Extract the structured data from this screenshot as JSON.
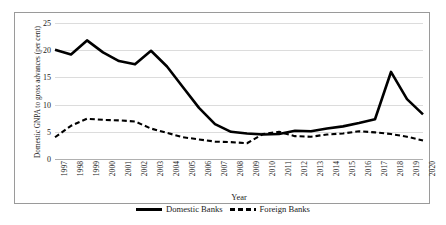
{
  "chart_data": {
    "type": "line",
    "title": "",
    "xlabel": "Year",
    "ylabel": "Domestic GNPA to gross advances (per cent)",
    "ylim": [
      0,
      25
    ],
    "yticks": [
      0,
      5,
      10,
      15,
      20,
      25
    ],
    "grid": true,
    "legend_position": "bottom",
    "categories": [
      "1997",
      "1998",
      "1999",
      "2000",
      "2001",
      "2002",
      "2003",
      "2004",
      "2005",
      "2006",
      "2007",
      "2008",
      "2009",
      "2010",
      "2011",
      "2012",
      "2013",
      "2014",
      "2015",
      "2016",
      "2017",
      "2018",
      "2019",
      "2020"
    ],
    "series": [
      {
        "name": "Domestic Banks",
        "style": "solid",
        "color": "#000000",
        "values": [
          20.1,
          19.2,
          21.8,
          19.6,
          18.0,
          17.4,
          19.9,
          17.0,
          13.2,
          9.4,
          6.4,
          5.0,
          4.7,
          4.5,
          4.6,
          5.2,
          5.1,
          5.6,
          6.0,
          6.6,
          7.3,
          16.0,
          11.0,
          8.2
        ]
      },
      {
        "name": "Foreign Banks",
        "style": "dashed",
        "color": "#000000",
        "values": [
          4.0,
          6.1,
          7.4,
          7.2,
          7.1,
          6.9,
          5.6,
          4.8,
          4.0,
          3.6,
          3.2,
          3.1,
          2.9,
          4.6,
          5.0,
          4.2,
          4.1,
          4.5,
          4.7,
          5.1,
          4.9,
          4.6,
          4.1,
          3.4
        ]
      }
    ]
  },
  "legend": {
    "items": [
      {
        "label": "Domestic Banks"
      },
      {
        "label": "Foreign Banks"
      }
    ]
  }
}
